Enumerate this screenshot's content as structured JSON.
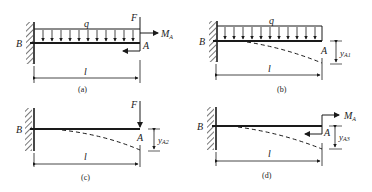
{
  "figure": {
    "panels": [
      {
        "id": "a",
        "caption": "(a)",
        "support_label": "B",
        "free_end_label": "A",
        "load_label": "q",
        "force_label": "F",
        "moment_label": "M",
        "moment_sub": "A",
        "span_label": "l"
      },
      {
        "id": "b",
        "caption": "(b)",
        "support_label": "B",
        "free_end_label": "A",
        "load_label": "q",
        "deflection_label": "y",
        "deflection_sub": "A1",
        "span_label": "l"
      },
      {
        "id": "c",
        "caption": "(c)",
        "support_label": "B",
        "free_end_label": "A",
        "force_label": "F",
        "deflection_label": "y",
        "deflection_sub": "A2",
        "span_label": "l"
      },
      {
        "id": "d",
        "caption": "(d)",
        "support_label": "B",
        "free_end_label": "A",
        "moment_label": "M",
        "moment_sub": "A",
        "deflection_label": "y",
        "deflection_sub": "A3",
        "span_label": "l"
      }
    ],
    "colors": {
      "ink": "#1a1a1a",
      "background": "#ffffff"
    }
  }
}
